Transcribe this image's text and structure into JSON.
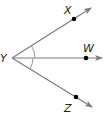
{
  "diagram": {
    "type": "angle-rays",
    "vertex": {
      "label": "Y",
      "x": 12,
      "y": 58
    },
    "rays": [
      {
        "name": "YX",
        "point_label": "X",
        "point": {
          "x": 74,
          "y": 19
        },
        "end": {
          "x": 91,
          "y": 8
        },
        "label_pos": {
          "x": 64,
          "y": 14
        }
      },
      {
        "name": "YW",
        "point_label": "W",
        "point": {
          "x": 86,
          "y": 58
        },
        "end": {
          "x": 102,
          "y": 58
        },
        "label_pos": {
          "x": 84,
          "y": 52
        }
      },
      {
        "name": "YZ",
        "point_label": "Z",
        "point": {
          "x": 76,
          "y": 97
        },
        "end": {
          "x": 92,
          "y": 107
        },
        "label_pos": {
          "x": 64,
          "y": 112
        }
      }
    ],
    "angle_marks": [
      {
        "between": [
          "YX",
          "YW"
        ],
        "radius": 23
      },
      {
        "between": [
          "YW",
          "YZ"
        ],
        "radius": 21
      }
    ],
    "colors": {
      "ray": "#7a7a7a",
      "point": "#000000",
      "label": "#222222"
    }
  }
}
